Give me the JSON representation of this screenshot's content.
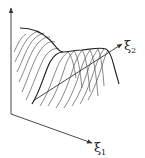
{
  "diagram": {
    "type": "3d-surface-sketch",
    "axes": {
      "vertical": {
        "label": ""
      },
      "x1": {
        "symbol": "ξ",
        "subscript": "1"
      },
      "x2": {
        "symbol": "ξ",
        "subscript": "2"
      }
    },
    "colors": {
      "stroke": "#333333",
      "background": "#ffffff"
    }
  }
}
